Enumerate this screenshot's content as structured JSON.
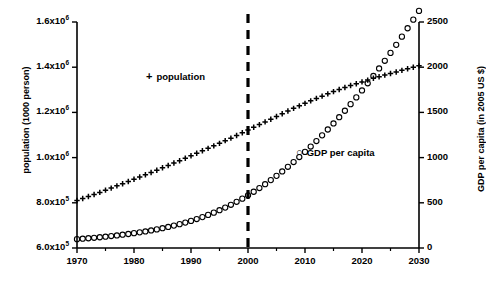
{
  "chart_data": {
    "type": "scatter",
    "title": "",
    "xlabel": "",
    "ylabel": "population (1000 person)",
    "y2label": "GDP per capita (in 2005 US $)",
    "xlim": [
      1970,
      2030
    ],
    "ylim": [
      600000,
      1600000
    ],
    "y2lim": [
      0,
      2500
    ],
    "grid": false,
    "legend_position": "inside",
    "x_ticks": [
      1970,
      1980,
      1990,
      2000,
      2010,
      2020,
      2030
    ],
    "x_tick_labels": [
      "1970",
      "1980",
      "1990",
      "2000",
      "2010",
      "2020",
      "2030"
    ],
    "x_minor_ticks": [
      1975,
      1985,
      1995,
      2005,
      2015,
      2025
    ],
    "y_ticks": [
      600000,
      800000,
      1000000,
      1200000,
      1400000,
      1600000
    ],
    "y_tick_labels": [
      "6.0x10⁵",
      "8.0x10⁵",
      "1.0x10⁶",
      "1.2x10⁶",
      "1.4x10⁶",
      "1.6x10⁶"
    ],
    "y2_ticks": [
      0,
      500,
      1000,
      1500,
      2000,
      2500
    ],
    "y2_tick_labels": [
      "0",
      "500",
      "1000",
      "1500",
      "2000",
      "2500"
    ],
    "annotations": [
      {
        "name": "year-2000-divider",
        "type": "vline",
        "x": 2000,
        "style": "dashed",
        "label": ""
      }
    ],
    "series": [
      {
        "name": "population",
        "marker": "+",
        "axis": "left",
        "x": [
          1970,
          1971,
          1972,
          1973,
          1974,
          1975,
          1976,
          1977,
          1978,
          1979,
          1980,
          1981,
          1982,
          1983,
          1984,
          1985,
          1986,
          1987,
          1988,
          1989,
          1990,
          1991,
          1992,
          1993,
          1994,
          1995,
          1996,
          1997,
          1998,
          1999,
          2000,
          2001,
          2002,
          2003,
          2004,
          2005,
          2006,
          2007,
          2008,
          2009,
          2010,
          2011,
          2012,
          2013,
          2014,
          2015,
          2016,
          2017,
          2018,
          2019,
          2020,
          2021,
          2022,
          2023,
          2024,
          2025,
          2026,
          2027,
          2028,
          2029,
          2030
        ],
        "values": [
          810000,
          819000,
          828000,
          837000,
          846000,
          856000,
          865000,
          875000,
          884000,
          894000,
          904000,
          914000,
          924000,
          934000,
          944000,
          955000,
          965000,
          976000,
          986000,
          997000,
          1008000,
          1019000,
          1030000,
          1041000,
          1052000,
          1063000,
          1075000,
          1086000,
          1098000,
          1110000,
          1122000,
          1134000,
          1146000,
          1158000,
          1170000,
          1182000,
          1194000,
          1206000,
          1218000,
          1229000,
          1240000,
          1251000,
          1262000,
          1272000,
          1282000,
          1292000,
          1301000,
          1310000,
          1319000,
          1327000,
          1335000,
          1343000,
          1351000,
          1358000,
          1365000,
          1372000,
          1379000,
          1386000,
          1393000,
          1400000,
          1406000
        ]
      },
      {
        "name": "GDP per capita",
        "marker": "○",
        "axis": "right",
        "x": [
          1970,
          1971,
          1972,
          1973,
          1974,
          1975,
          1976,
          1977,
          1978,
          1979,
          1980,
          1981,
          1982,
          1983,
          1984,
          1985,
          1986,
          1987,
          1988,
          1989,
          1990,
          1991,
          1992,
          1993,
          1994,
          1995,
          1996,
          1997,
          1998,
          1999,
          2000,
          2001,
          2002,
          2003,
          2004,
          2005,
          2006,
          2007,
          2008,
          2009,
          2010,
          2011,
          2012,
          2013,
          2014,
          2015,
          2016,
          2017,
          2018,
          2019,
          2020,
          2021,
          2022,
          2023,
          2024,
          2025,
          2026,
          2027,
          2028,
          2029,
          2030
        ],
        "values": [
          98,
          103,
          108,
          113,
          119,
          125,
          132,
          139,
          147,
          155,
          164,
          173,
          183,
          194,
          206,
          219,
          233,
          248,
          264,
          281,
          300,
          320,
          342,
          366,
          391,
          418,
          447,
          478,
          511,
          546,
          583,
          622,
          663,
          706,
          751,
          798,
          847,
          898,
          951,
          1006,
          1063,
          1122,
          1183,
          1246,
          1311,
          1378,
          1447,
          1518,
          1591,
          1666,
          1743,
          1822,
          1903,
          1986,
          2071,
          2158,
          2247,
          2338,
          2431,
          2526,
          2623
        ]
      }
    ]
  },
  "axes": {
    "left_title": "population (1000 person)",
    "right_title": "GDP per capita (in 2005 US $)"
  },
  "legend": {
    "population": {
      "marker": "+",
      "label": "population"
    },
    "gdp": {
      "marker": "○",
      "label": "GDP per capita"
    }
  },
  "colors": {
    "axis": "#000000",
    "series": "#000000",
    "background": "#ffffff"
  }
}
